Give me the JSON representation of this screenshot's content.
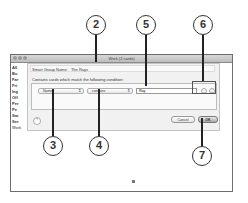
{
  "window": {
    "title": "Work (2 cards)"
  },
  "sidebar": {
    "items": [
      "All",
      "Bu",
      "Far",
      "Fri",
      "Ing",
      "Off",
      "Per",
      "Pe",
      "Sar",
      "Ser"
    ],
    "last": "Work"
  },
  "sheet": {
    "name_label": "Smart Group Name:",
    "name_value": "The Rays",
    "contains_label": "Contains cards which match the following condition:",
    "field_popup": "Name",
    "operator_popup": "contains",
    "value_input": "Ray",
    "remove_label": "–",
    "add_label": "+",
    "help_label": "?",
    "cancel_label": "Cancel",
    "ok_label": "OK"
  },
  "callouts": [
    "2",
    "3",
    "4",
    "5",
    "6",
    "7"
  ]
}
